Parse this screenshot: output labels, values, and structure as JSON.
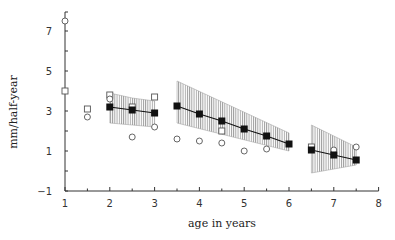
{
  "chart_data": {
    "type": "scatter",
    "title": "",
    "xlabel": "age in years",
    "ylabel": "mm/half-year",
    "xlim": [
      1,
      8
    ],
    "ylim": [
      -1,
      8
    ],
    "xticks": [
      1,
      2,
      3,
      4,
      5,
      6,
      7,
      8
    ],
    "xtick_labels": [
      "1",
      "2",
      "3",
      "4",
      "5",
      "6",
      "7",
      "8"
    ],
    "yticks": [
      -1,
      1,
      3,
      5,
      7
    ],
    "ytick_labels": [
      "−1",
      "1",
      "3",
      "5",
      "7"
    ],
    "grid": false,
    "legend": null,
    "series": [
      {
        "name": "mean (filled squares, line)",
        "marker": "filled-square",
        "segments": [
          {
            "x": [
              2,
              2.5,
              3
            ],
            "y": [
              3.2,
              3.05,
              2.9
            ]
          },
          {
            "x": [
              3.5,
              4,
              4.5,
              5,
              5.5,
              6
            ],
            "y": [
              3.25,
              2.85,
              2.5,
              2.1,
              1.75,
              1.35
            ]
          },
          {
            "x": [
              6.5,
              7,
              7.5
            ],
            "y": [
              1.05,
              0.8,
              0.55
            ]
          }
        ]
      },
      {
        "name": "confidence band (hatched)",
        "type": "band",
        "segments": [
          {
            "x": [
              2,
              2.5,
              3
            ],
            "upper": [
              3.9,
              3.65,
              3.5
            ],
            "lower": [
              2.4,
              2.3,
              2.2
            ]
          },
          {
            "x": [
              3.5,
              6
            ],
            "upper": [
              4.5,
              1.9
            ],
            "lower": [
              2.4,
              1.0
            ]
          },
          {
            "x": [
              6.5,
              7.5
            ],
            "upper": [
              2.3,
              1.2
            ],
            "lower": [
              -0.1,
              0.3
            ]
          }
        ]
      },
      {
        "name": "open squares",
        "marker": "open-square",
        "x": [
          1.0,
          1.5,
          2.0,
          2.5,
          3.0,
          4.5,
          6.5
        ],
        "y": [
          4.0,
          3.1,
          3.8,
          3.2,
          3.7,
          2.0,
          1.2
        ]
      },
      {
        "name": "open circles",
        "marker": "open-circle",
        "x": [
          1.0,
          1.5,
          2.0,
          2.5,
          3.0,
          3.5,
          4.0,
          4.5,
          5.0,
          5.5,
          7.0,
          7.5
        ],
        "y": [
          7.5,
          2.7,
          3.6,
          1.7,
          2.2,
          1.6,
          1.5,
          1.4,
          1.0,
          1.1,
          1.05,
          1.2
        ]
      }
    ]
  },
  "colors": {
    "axis": "#333333",
    "mean": "#111111",
    "band_hatch": "#888888",
    "open_marker": "#555555"
  }
}
